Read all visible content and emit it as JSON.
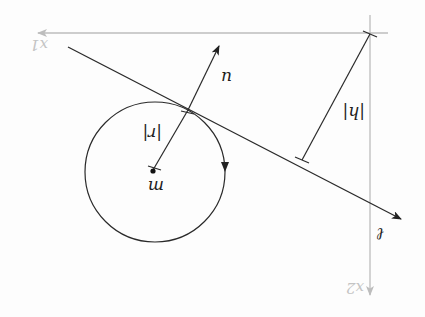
{
  "diagram": {
    "orientation": "rotated 180 degrees",
    "colors": {
      "ink": "#2a2a2a",
      "axis": "#bdbdbd",
      "axis_label": "#c4c4c4"
    },
    "axes": {
      "x1": {
        "label": "x1"
      },
      "x2": {
        "label": "x2"
      }
    },
    "circle": {
      "center_label": "m",
      "radius_label": "|r|",
      "direction": "arrow on circumference"
    },
    "tangent_line": {
      "label": "ℓ"
    },
    "normal_vector": {
      "label": "u"
    },
    "distance": {
      "label": "|h|"
    }
  }
}
